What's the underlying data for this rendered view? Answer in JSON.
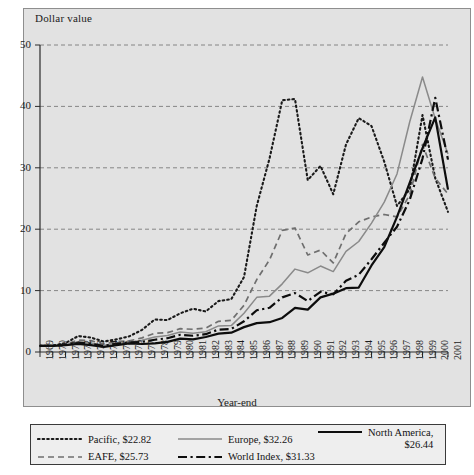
{
  "figure": {
    "y_axis_label": "Dollar value",
    "x_axis_label": "Year-end",
    "background_color": "#e2e2e2",
    "frame_color": "#8e8e8e"
  },
  "legend": {
    "entries": [
      {
        "label": "Pacific, $22.82",
        "style": "dotted",
        "color": "#1a1a1a",
        "icon": "dotted-line-swatch"
      },
      {
        "label": "Europe, $32.26",
        "style": "solid-gray",
        "color": "#8a8a8a",
        "icon": "solid-gray-line-swatch"
      },
      {
        "label": "North America,",
        "label2": "$26.44",
        "style": "solid-black",
        "color": "#0d0d0d",
        "icon": "solid-black-line-swatch"
      },
      {
        "label": "EAFE, $25.73",
        "style": "dashed",
        "color": "#6f6f6f",
        "icon": "dashed-line-swatch"
      },
      {
        "label": "World Index, $31.33",
        "style": "dash-dot",
        "color": "#0d0d0d",
        "icon": "dash-dot-line-swatch"
      }
    ]
  },
  "chart_data": {
    "type": "line",
    "title": "",
    "xlabel": "Year-end",
    "ylabel": "Dollar value",
    "xlim": [
      1969,
      2001
    ],
    "ylim": [
      0,
      50
    ],
    "yticks": [
      0,
      10,
      20,
      30,
      40,
      50
    ],
    "grid": "horizontal-dashed",
    "legend_position": "below-plot",
    "x": [
      1969,
      1970,
      1971,
      1972,
      1973,
      1974,
      1975,
      1976,
      1977,
      1978,
      1979,
      1980,
      1981,
      1982,
      1983,
      1984,
      1985,
      1986,
      1987,
      1988,
      1989,
      1990,
      1991,
      1992,
      1993,
      1994,
      1995,
      1996,
      1997,
      1998,
      1999,
      2000,
      2001
    ],
    "series": [
      {
        "name": "Pacific",
        "final_value": 22.82,
        "style": "dotted",
        "color": "#1a1a1a",
        "values": [
          1.0,
          1.05,
          1.45,
          2.6,
          2.35,
          1.7,
          2.05,
          2.55,
          3.6,
          5.3,
          5.2,
          6.3,
          7.05,
          6.6,
          8.3,
          8.6,
          12.2,
          23.8,
          31.5,
          41.0,
          41.2,
          28.0,
          30.3,
          25.7,
          33.8,
          38.1,
          36.8,
          31.0,
          23.8,
          26.5,
          38.6,
          28.3,
          22.82
        ]
      },
      {
        "name": "EAFE",
        "final_value": 25.73,
        "style": "dashed",
        "color": "#6f6f6f",
        "values": [
          1.0,
          0.95,
          1.25,
          1.95,
          1.85,
          1.3,
          1.7,
          1.8,
          2.3,
          3.05,
          3.15,
          3.8,
          3.7,
          3.9,
          5.0,
          5.15,
          7.6,
          11.8,
          15.0,
          19.8,
          20.2,
          15.8,
          16.6,
          14.5,
          19.3,
          21.2,
          22.0,
          22.4,
          22.0,
          25.6,
          33.8,
          28.3,
          25.73
        ]
      },
      {
        "name": "Europe",
        "final_value": 32.26,
        "style": "solid-gray",
        "color": "#8a8a8a",
        "values": [
          1.0,
          0.92,
          1.15,
          1.6,
          1.45,
          1.05,
          1.45,
          1.55,
          1.9,
          2.45,
          2.7,
          3.25,
          3.05,
          3.3,
          4.25,
          4.3,
          6.3,
          8.9,
          9.1,
          11.1,
          13.5,
          12.9,
          14.0,
          13.1,
          16.4,
          18.0,
          21.0,
          24.4,
          29.0,
          37.5,
          44.8,
          38.0,
          32.26
        ]
      },
      {
        "name": "World Index",
        "final_value": 31.33,
        "style": "dash-dot",
        "color": "#0d0d0d",
        "values": [
          1.0,
          0.98,
          1.2,
          1.55,
          1.35,
          1.0,
          1.35,
          1.55,
          1.65,
          2.0,
          2.25,
          2.8,
          2.65,
          2.9,
          3.65,
          3.75,
          5.0,
          6.8,
          7.2,
          8.9,
          9.6,
          8.3,
          9.8,
          9.4,
          11.6,
          12.6,
          15.1,
          17.8,
          20.4,
          24.8,
          31.5,
          41.4,
          31.33
        ]
      },
      {
        "name": "North America",
        "final_value": 26.44,
        "style": "solid-black",
        "color": "#0d0d0d",
        "values": [
          1.0,
          1.0,
          1.12,
          1.32,
          1.12,
          0.82,
          1.12,
          1.4,
          1.3,
          1.4,
          1.65,
          2.18,
          2.05,
          2.45,
          3.0,
          3.15,
          4.05,
          4.7,
          4.85,
          5.55,
          7.2,
          6.9,
          8.9,
          9.5,
          10.4,
          10.5,
          14.1,
          17.1,
          22.0,
          27.6,
          33.2,
          38.2,
          26.44
        ]
      }
    ]
  }
}
